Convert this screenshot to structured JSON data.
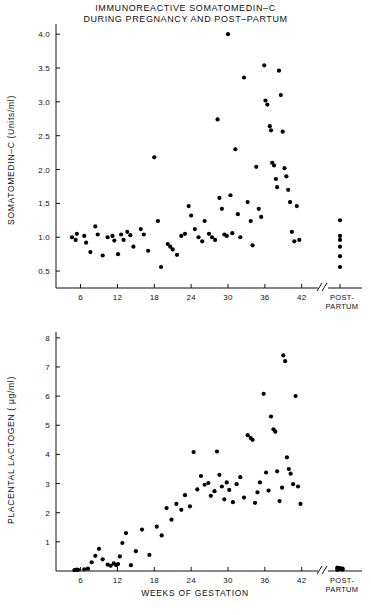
{
  "title": {
    "line1": "IMMUNOREACTIVE  SOMATOMEDIN–C",
    "line2": "DURING PREGNANCY AND POST–PARTUM"
  },
  "axes": {
    "x_label": "WEEKS OF GESTATION",
    "postpartum_line1": "POST-",
    "postpartum_line2": "PARTUM"
  },
  "chart_data": [
    {
      "type": "scatter",
      "title": "IMMUNOREACTIVE  SOMATOMEDIN–C DURING PREGNANCY AND POST–PARTUM",
      "xlabel": "WEEKS OF GESTATION",
      "ylabel": "SOMATOMEDIN–C (Units/ml)",
      "xlim": [
        2,
        44
      ],
      "ylim": [
        0.25,
        4.15
      ],
      "xticks": [
        6,
        12,
        18,
        24,
        30,
        36,
        42
      ],
      "yticks": [
        0.5,
        1.0,
        1.5,
        2.0,
        2.5,
        3.0,
        3.5,
        4.0
      ],
      "ytick_labels": [
        "0.5",
        "1.0",
        "1.5",
        "2.0",
        "2.5",
        "3.0",
        "3.5",
        "4.0"
      ],
      "grid": false,
      "legend": false,
      "axis_break": true,
      "points": [
        [
          4.6,
          1.0
        ],
        [
          5.2,
          0.96
        ],
        [
          5.4,
          1.05
        ],
        [
          6.6,
          1.02
        ],
        [
          6.9,
          0.92
        ],
        [
          7.6,
          0.78
        ],
        [
          8.4,
          1.16
        ],
        [
          8.8,
          1.04
        ],
        [
          9.6,
          0.73
        ],
        [
          10.4,
          1.0
        ],
        [
          11.2,
          1.02
        ],
        [
          11.5,
          0.95
        ],
        [
          12.1,
          0.75
        ],
        [
          12.6,
          1.04
        ],
        [
          13.0,
          0.96
        ],
        [
          13.6,
          1.08
        ],
        [
          14.1,
          1.03
        ],
        [
          14.6,
          0.86
        ],
        [
          15.8,
          1.12
        ],
        [
          16.3,
          1.04
        ],
        [
          17.0,
          0.8
        ],
        [
          18.0,
          2.18
        ],
        [
          18.6,
          1.24
        ],
        [
          19.1,
          0.56
        ],
        [
          20.2,
          0.9
        ],
        [
          20.6,
          0.86
        ],
        [
          21.0,
          0.82
        ],
        [
          21.7,
          0.74
        ],
        [
          22.4,
          1.02
        ],
        [
          23.0,
          1.05
        ],
        [
          23.6,
          1.46
        ],
        [
          24.0,
          1.32
        ],
        [
          24.6,
          1.12
        ],
        [
          25.2,
          1.0
        ],
        [
          25.8,
          0.94
        ],
        [
          26.2,
          1.24
        ],
        [
          26.9,
          1.05
        ],
        [
          27.4,
          1.0
        ],
        [
          27.9,
          0.96
        ],
        [
          28.3,
          2.74
        ],
        [
          28.6,
          1.58
        ],
        [
          29.0,
          1.42
        ],
        [
          29.4,
          1.04
        ],
        [
          29.8,
          1.02
        ],
        [
          30.0,
          4.0
        ],
        [
          30.4,
          1.62
        ],
        [
          30.7,
          1.06
        ],
        [
          31.2,
          2.3
        ],
        [
          31.6,
          1.34
        ],
        [
          32.0,
          1.0
        ],
        [
          32.6,
          3.36
        ],
        [
          33.2,
          1.52
        ],
        [
          33.7,
          1.24
        ],
        [
          34.0,
          0.88
        ],
        [
          34.6,
          2.04
        ],
        [
          35.0,
          1.42
        ],
        [
          35.4,
          1.3
        ],
        [
          35.9,
          3.54
        ],
        [
          36.1,
          3.02
        ],
        [
          36.4,
          2.96
        ],
        [
          36.8,
          2.64
        ],
        [
          37.0,
          2.58
        ],
        [
          37.2,
          2.1
        ],
        [
          37.5,
          2.06
        ],
        [
          37.8,
          1.86
        ],
        [
          38.0,
          1.74
        ],
        [
          38.3,
          3.46
        ],
        [
          38.6,
          3.1
        ],
        [
          38.9,
          2.56
        ],
        [
          39.2,
          2.02
        ],
        [
          39.5,
          1.9
        ],
        [
          39.8,
          1.7
        ],
        [
          40.1,
          1.52
        ],
        [
          40.4,
          1.08
        ],
        [
          40.8,
          0.94
        ],
        [
          41.2,
          1.46
        ],
        [
          41.6,
          0.96
        ]
      ],
      "postpartum_points": [
        1.25,
        1.02,
        0.96,
        0.86,
        0.72,
        0.56
      ]
    },
    {
      "type": "scatter",
      "xlabel": "WEEKS OF GESTATION",
      "ylabel": "PLACENTAL LACTOGEN ( µg/ml)",
      "xlim": [
        2,
        44
      ],
      "ylim": [
        0,
        8.2
      ],
      "xticks": [
        6,
        12,
        18,
        24,
        30,
        36,
        42
      ],
      "yticks": [
        1,
        2,
        3,
        4,
        5,
        6,
        7,
        8
      ],
      "ytick_labels": [
        "1",
        "2",
        "3",
        "4",
        "5",
        "6",
        "7",
        "8"
      ],
      "grid": false,
      "legend": false,
      "axis_break": true,
      "points": [
        [
          5.0,
          0.03
        ],
        [
          5.4,
          0.05
        ],
        [
          5.6,
          0.04
        ],
        [
          6.6,
          0.06
        ],
        [
          7.2,
          0.08
        ],
        [
          7.8,
          0.3
        ],
        [
          8.4,
          0.52
        ],
        [
          9.0,
          0.76
        ],
        [
          9.6,
          0.4
        ],
        [
          10.4,
          0.22
        ],
        [
          10.9,
          0.18
        ],
        [
          11.4,
          0.26
        ],
        [
          11.8,
          0.2
        ],
        [
          12.1,
          0.24
        ],
        [
          12.4,
          0.5
        ],
        [
          12.8,
          0.96
        ],
        [
          13.4,
          1.3
        ],
        [
          14.2,
          0.2
        ],
        [
          15.0,
          0.68
        ],
        [
          16.0,
          1.42
        ],
        [
          17.2,
          0.55
        ],
        [
          18.4,
          1.52
        ],
        [
          19.2,
          1.22
        ],
        [
          20.0,
          2.16
        ],
        [
          20.8,
          1.76
        ],
        [
          21.6,
          2.3
        ],
        [
          22.4,
          2.1
        ],
        [
          23.0,
          2.6
        ],
        [
          23.8,
          2.22
        ],
        [
          24.4,
          4.08
        ],
        [
          25.0,
          2.8
        ],
        [
          25.6,
          3.26
        ],
        [
          26.2,
          2.96
        ],
        [
          26.8,
          3.02
        ],
        [
          27.2,
          2.58
        ],
        [
          27.8,
          2.74
        ],
        [
          28.2,
          4.1
        ],
        [
          28.6,
          3.3
        ],
        [
          29.0,
          2.9
        ],
        [
          29.4,
          2.46
        ],
        [
          29.8,
          3.04
        ],
        [
          30.2,
          2.78
        ],
        [
          30.8,
          2.36
        ],
        [
          31.4,
          2.98
        ],
        [
          32.0,
          3.22
        ],
        [
          32.6,
          2.52
        ],
        [
          33.2,
          4.66
        ],
        [
          33.7,
          4.56
        ],
        [
          34.0,
          4.5
        ],
        [
          34.4,
          2.34
        ],
        [
          34.8,
          2.7
        ],
        [
          35.2,
          3.04
        ],
        [
          35.8,
          6.08
        ],
        [
          36.2,
          3.38
        ],
        [
          36.6,
          2.76
        ],
        [
          37.0,
          5.3
        ],
        [
          37.4,
          4.86
        ],
        [
          37.7,
          4.78
        ],
        [
          38.0,
          3.42
        ],
        [
          38.4,
          2.4
        ],
        [
          38.8,
          2.86
        ],
        [
          39.0,
          7.4
        ],
        [
          39.3,
          7.2
        ],
        [
          39.6,
          3.9
        ],
        [
          39.9,
          3.5
        ],
        [
          40.2,
          3.34
        ],
        [
          40.6,
          2.98
        ],
        [
          41.0,
          6.0
        ],
        [
          41.4,
          2.9
        ],
        [
          41.8,
          2.3
        ]
      ],
      "postpartum_points": [
        0.12,
        0.1,
        0.08,
        0.07,
        0.06,
        0.05,
        0.04
      ]
    }
  ]
}
